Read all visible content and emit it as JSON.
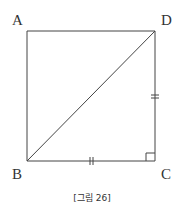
{
  "figure": {
    "type": "square-with-diagonal",
    "vertices": {
      "A": {
        "label": "A",
        "x": 27,
        "y": 31
      },
      "D": {
        "label": "D",
        "x": 155,
        "y": 31
      },
      "B": {
        "label": "B",
        "x": 27,
        "y": 161
      },
      "C": {
        "label": "C",
        "x": 155,
        "y": 161
      }
    },
    "segments": [
      "AB",
      "AD",
      "DC",
      "BC",
      "BD"
    ],
    "equal_marks": [
      "BC",
      "DC"
    ],
    "right_angle_at": "C",
    "caption": "[그림 26]",
    "stroke_color": "#444444"
  }
}
